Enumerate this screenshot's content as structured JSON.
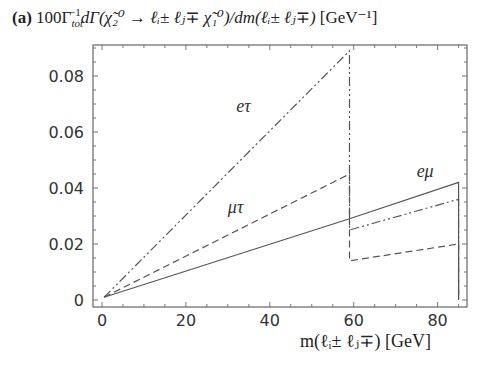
{
  "chart_data": {
    "type": "line",
    "panel": "(a)",
    "title_parts": {
      "panel": "(a)",
      "expr": "100Γ",
      "sub": "tot",
      "sup": "−1",
      "rest": "dΓ(χ̃₂⁰ → ℓᵢ± ℓⱼ∓ χ̃₁⁰)/dm(ℓᵢ± ℓⱼ∓)",
      "unit": "[GeV⁻¹]"
    },
    "xlabel": "m(ℓi^± ℓj^∓) [GeV]",
    "xlabel_display": "m(ℓᵢ± ℓⱼ∓) [GeV]",
    "ylabel": "",
    "xlim": [
      -0.5,
      88
    ],
    "ylim": [
      -0.0025,
      0.0915
    ],
    "xticks": [
      "0",
      "20",
      "40",
      "60",
      "80"
    ],
    "yticks": [
      "0",
      "0.02",
      "0.04",
      "0.06",
      "0.08"
    ],
    "grid": false,
    "legend": "inline labels",
    "series": [
      {
        "name": "eμ",
        "style": "solid",
        "x": [
          0.5,
          59,
          85,
          85
        ],
        "values": [
          0.001,
          0.029,
          0.042,
          0.0
        ]
      },
      {
        "name": "eτ",
        "style": "dash-dot-dot",
        "x": [
          0.5,
          59,
          59,
          85,
          85
        ],
        "values": [
          0.001,
          0.089,
          0.025,
          0.036,
          0.0
        ]
      },
      {
        "name": "μτ",
        "style": "dashed",
        "x": [
          0.5,
          59,
          59,
          85,
          85
        ],
        "values": [
          0.001,
          0.045,
          0.014,
          0.02,
          0.0
        ]
      }
    ],
    "annotations": [
      {
        "text": "eτ",
        "x": 32,
        "y": 0.067
      },
      {
        "text": "μτ",
        "x": 30,
        "y": 0.031
      },
      {
        "text": "eμ",
        "x": 75,
        "y": 0.044
      }
    ]
  }
}
